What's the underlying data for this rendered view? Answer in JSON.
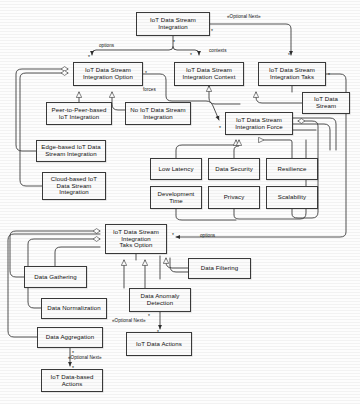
{
  "diagram": {
    "type": "uml-class-diagram",
    "canvas": {
      "width": 360,
      "height": 404
    },
    "style": {
      "node_fill": "#fbfbfb",
      "node_stroke": "#3a3a3a",
      "edge_stroke": "#333333",
      "text": "#101010"
    }
  },
  "nodes": [
    {
      "id": "integration",
      "label": "IoT Data Stream\nIntegration",
      "x": 136,
      "y": 12,
      "w": 74,
      "h": 24
    },
    {
      "id": "option",
      "label": "IoT Data Stream\nIntegration Option",
      "x": 73,
      "y": 62,
      "w": 70,
      "h": 24
    },
    {
      "id": "context",
      "label": "IoT Data Stream\nIntegration Context",
      "x": 174,
      "y": 62,
      "w": 70,
      "h": 24
    },
    {
      "id": "taks",
      "label": "IoT Data Stream\nIntegration Taks",
      "x": 258,
      "y": 62,
      "w": 68,
      "h": 24
    },
    {
      "id": "p2p",
      "label": "Peer-to-Peer-based\nIoT Integration",
      "x": 46,
      "y": 102,
      "w": 66,
      "h": 23
    },
    {
      "id": "noint",
      "label": "No IoT Data Stream\nIntegration",
      "x": 125,
      "y": 102,
      "w": 66,
      "h": 23
    },
    {
      "id": "edge",
      "label": "Edge-based IoT Data\nStream Integration",
      "x": 36,
      "y": 140,
      "w": 70,
      "h": 22
    },
    {
      "id": "cloud",
      "label": "Cloud-based IoT\nData Stream\nIntegration",
      "x": 42,
      "y": 172,
      "w": 64,
      "h": 28
    },
    {
      "id": "stream",
      "label": "IoT Data\nStream",
      "x": 302,
      "y": 92,
      "w": 48,
      "h": 22
    },
    {
      "id": "force",
      "label": "IoT Data Stream\nIntegration Force",
      "x": 225,
      "y": 112,
      "w": 68,
      "h": 23
    },
    {
      "id": "lowlatency",
      "label": "Low Latency",
      "x": 150,
      "y": 158,
      "w": 52,
      "h": 22
    },
    {
      "id": "datasecurity",
      "label": "Data Security",
      "x": 208,
      "y": 158,
      "w": 52,
      "h": 22
    },
    {
      "id": "resilience",
      "label": "Resilience",
      "x": 266,
      "y": 158,
      "w": 52,
      "h": 22
    },
    {
      "id": "devtime",
      "label": "Development\nTime",
      "x": 150,
      "y": 186,
      "w": 52,
      "h": 23
    },
    {
      "id": "privacy",
      "label": "Privacy",
      "x": 208,
      "y": 186,
      "w": 52,
      "h": 23
    },
    {
      "id": "scalability",
      "label": "Scalability",
      "x": 266,
      "y": 186,
      "w": 52,
      "h": 23
    },
    {
      "id": "taksoption",
      "label": "IoT Data Stream\nIntegration\nTaks Option",
      "x": 105,
      "y": 224,
      "w": 62,
      "h": 30
    },
    {
      "id": "gathering",
      "label": "Data Gathering",
      "x": 24,
      "y": 266,
      "w": 63,
      "h": 22
    },
    {
      "id": "filtering",
      "label": "Data Filtering",
      "x": 188,
      "y": 258,
      "w": 63,
      "h": 21
    },
    {
      "id": "normalization",
      "label": "Data Normalization",
      "x": 41,
      "y": 298,
      "w": 66,
      "h": 21
    },
    {
      "id": "anomaly",
      "label": "Data Anomaly\nDetection",
      "x": 129,
      "y": 288,
      "w": 62,
      "h": 24
    },
    {
      "id": "aggregation",
      "label": "Data Aggregation",
      "x": 37,
      "y": 327,
      "w": 66,
      "h": 21
    },
    {
      "id": "actions",
      "label": "IoT Data Actions",
      "x": 126,
      "y": 332,
      "w": 66,
      "h": 24
    },
    {
      "id": "basedactions",
      "label": "IoT Data-based\nActions",
      "x": 41,
      "y": 369,
      "w": 62,
      "h": 23
    }
  ],
  "edge_labels": [
    {
      "id": "optional-next-top",
      "text": "«Optional Next»",
      "x": 227,
      "y": 14
    },
    {
      "id": "options-top",
      "text": "options",
      "x": 99,
      "y": 43
    },
    {
      "id": "contexts",
      "text": "contexts",
      "x": 209,
      "y": 48
    },
    {
      "id": "forces",
      "text": "forces",
      "x": 143,
      "y": 87
    },
    {
      "id": "options-taks",
      "text": "options",
      "x": 200,
      "y": 233
    },
    {
      "id": "optional-next-anom",
      "text": "«Optional Next»",
      "x": 112,
      "y": 318
    },
    {
      "id": "optional-next-aggr",
      "text": "«Optional Next»",
      "x": 68,
      "y": 355
    }
  ],
  "multiplicities": [
    {
      "id": "m1",
      "text": "*",
      "x": 211,
      "y": 28
    },
    {
      "id": "m2",
      "text": "*",
      "x": 173,
      "y": 39
    },
    {
      "id": "m3",
      "text": "*",
      "x": 88,
      "y": 54
    },
    {
      "id": "m4",
      "text": "*",
      "x": 190,
      "y": 52
    },
    {
      "id": "m5",
      "text": "*",
      "x": 288,
      "y": 52
    },
    {
      "id": "m6",
      "text": "*",
      "x": 145,
      "y": 70
    },
    {
      "id": "m7",
      "text": "*",
      "x": 328,
      "y": 72
    },
    {
      "id": "m8",
      "text": "*",
      "x": 219,
      "y": 125
    },
    {
      "id": "m9",
      "text": "*",
      "x": 172,
      "y": 232
    },
    {
      "id": "m10",
      "text": "*",
      "x": 148,
      "y": 313
    },
    {
      "id": "m11",
      "text": "*",
      "x": 157,
      "y": 329
    },
    {
      "id": "m12",
      "text": "*",
      "x": 72,
      "y": 350
    },
    {
      "id": "m13",
      "text": "*",
      "x": 72,
      "y": 365
    }
  ]
}
